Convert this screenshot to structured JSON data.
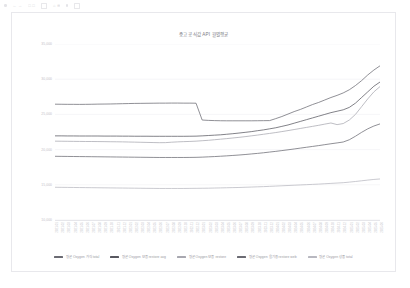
{
  "toolbar": {
    "items": [
      "≡",
      "← →",
      "□ □",
      "↻",
      "⌂ ⊕",
      "⋯"
    ],
    "glyph_names": [
      "menu-icon",
      "nav-arrows",
      "window-controls",
      "reload-icon",
      "home-icon",
      "overflow-icon"
    ]
  },
  "card": {
    "title": "중고 공식값 API 월별평균"
  },
  "chart_data": {
    "type": "line",
    "title": "중고 공식값 API 월별평균",
    "xlabel": "",
    "ylabel": "",
    "grid": true,
    "legend_position": "bottom",
    "ylim": [
      10000,
      35000
    ],
    "yticks": [
      35000,
      30000,
      25000,
      20000,
      15000,
      10000
    ],
    "ytick_labels": [
      "35,000",
      "30,000",
      "25,000",
      "20,000",
      "15,000",
      "10,000"
    ],
    "x": [
      "2021-01",
      "2021-02",
      "2021-03",
      "2021-04",
      "2021-05",
      "2021-06",
      "2021-07",
      "2021-08",
      "2021-09",
      "2021-10",
      "2021-11",
      "2021-12",
      "2022-01",
      "2022-02",
      "2022-03",
      "2022-04",
      "2022-05",
      "2022-06",
      "2022-07",
      "2022-08",
      "2022-09",
      "2022-10",
      "2022-11",
      "2022-12",
      "2023-01",
      "2023-02",
      "2023-03",
      "2023-04",
      "2023-05",
      "2023-06",
      "2023-07",
      "2023-08",
      "2023-09",
      "2023-10",
      "2023-11",
      "2023-12",
      "2024-01",
      "2024-02",
      "2024-03",
      "2024-04",
      "2024-05",
      "2024-06",
      "2024-07",
      "2024-08",
      "2024-09",
      "2024-10",
      "2024-11",
      "2024-12",
      "2025-01",
      "2025-02",
      "2025-03",
      "2025-04",
      "2025-05",
      "2025-06"
    ],
    "series": [
      {
        "name": "평균 Oxygen 가격 total",
        "color": "#6b6b73",
        "values": [
          26450,
          26440,
          26430,
          26430,
          26420,
          26430,
          26440,
          26460,
          26470,
          26480,
          26500,
          26520,
          26540,
          26560,
          26570,
          26580,
          26590,
          26600,
          26600,
          26610,
          26610,
          26600,
          26600,
          26590,
          24200,
          24150,
          24120,
          24100,
          24090,
          24090,
          24090,
          24090,
          24090,
          24100,
          24110,
          24120,
          24400,
          24700,
          25050,
          25400,
          25700,
          26050,
          26400,
          26700,
          27050,
          27400,
          27700,
          28050,
          28500,
          29100,
          29800,
          30600,
          31300,
          31900
        ]
      },
      {
        "name": "평균 Oxygen 보증 restore avg",
        "color": "#585860",
        "values": [
          21950,
          21950,
          21940,
          21940,
          21930,
          21930,
          21930,
          21930,
          21920,
          21920,
          21920,
          21910,
          21910,
          21900,
          21900,
          21900,
          21890,
          21890,
          21890,
          21890,
          21890,
          21890,
          21900,
          21910,
          21950,
          22000,
          22050,
          22100,
          22180,
          22260,
          22350,
          22450,
          22550,
          22680,
          22800,
          22950,
          23100,
          23300,
          23500,
          23750,
          24000,
          24250,
          24500,
          24750,
          25000,
          25250,
          25450,
          25650,
          26000,
          26600,
          27400,
          28200,
          29000,
          29600
        ]
      },
      {
        "name": "평균 Oxygen 보증 restore",
        "color": "#a8a8b0",
        "values": [
          21200,
          21190,
          21180,
          21170,
          21160,
          21150,
          21150,
          21140,
          21130,
          21120,
          21110,
          21100,
          21080,
          21060,
          21040,
          21020,
          21000,
          20980,
          20990,
          21050,
          21100,
          21130,
          21160,
          21200,
          21260,
          21320,
          21400,
          21480,
          21560,
          21650,
          21740,
          21840,
          21950,
          22060,
          22180,
          22300,
          22420,
          22560,
          22700,
          22850,
          23000,
          23150,
          23300,
          23450,
          23620,
          23780,
          23550,
          23700,
          24200,
          25000,
          26100,
          27200,
          28200,
          28950
        ]
      },
      {
        "name": "평균 Oxygen 올기용 restore web",
        "color": "#6b6b73",
        "values": [
          19050,
          19040,
          19030,
          19020,
          19010,
          19000,
          18990,
          18980,
          18970,
          18960,
          18950,
          18940,
          18930,
          18920,
          18910,
          18900,
          18890,
          18880,
          18880,
          18880,
          18880,
          18880,
          18890,
          18900,
          18930,
          18970,
          19010,
          19060,
          19110,
          19170,
          19230,
          19300,
          19380,
          19460,
          19550,
          19650,
          19750,
          19860,
          19970,
          20090,
          20210,
          20330,
          20450,
          20570,
          20700,
          20830,
          20950,
          21080,
          21400,
          21900,
          22450,
          22950,
          23350,
          23650
        ]
      },
      {
        "name": "평균 Oxygen 상품 total",
        "color": "#b8b8c0",
        "values": [
          14650,
          14640,
          14630,
          14620,
          14610,
          14600,
          14590,
          14580,
          14570,
          14560,
          14550,
          14540,
          14530,
          14520,
          14510,
          14500,
          14490,
          14480,
          14480,
          14480,
          14480,
          14480,
          14490,
          14500,
          14510,
          14520,
          14540,
          14560,
          14580,
          14600,
          14620,
          14650,
          14680,
          14710,
          14740,
          14780,
          14820,
          14860,
          14900,
          14940,
          14980,
          15020,
          15060,
          15100,
          15150,
          15200,
          15250,
          15300,
          15380,
          15470,
          15570,
          15670,
          15760,
          15830
        ]
      }
    ]
  }
}
